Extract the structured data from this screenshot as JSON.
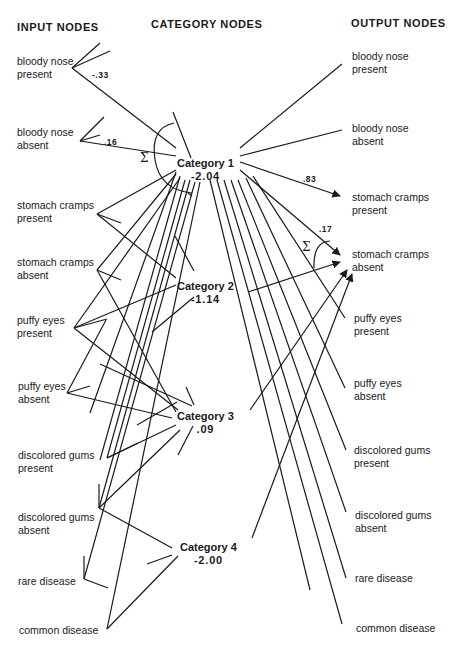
{
  "headers": {
    "input": "INPUT NODES",
    "category": "CATEGORY NODES",
    "output": "OUTPUT NODES"
  },
  "input_nodes": [
    {
      "label": "bloody nose\npresent",
      "x": 17,
      "y": 55,
      "anchor": [
        72,
        68
      ]
    },
    {
      "label": "bloody nose\nabsent",
      "x": 17,
      "y": 126,
      "anchor": [
        80,
        141
      ]
    },
    {
      "label": "stomach cramps\npresent",
      "x": 17,
      "y": 199,
      "anchor": [
        97,
        214
      ]
    },
    {
      "label": "stomach cramps\nabsent",
      "x": 17,
      "y": 256,
      "anchor": [
        97,
        270
      ]
    },
    {
      "label": "puffy eyes\npresent",
      "x": 17,
      "y": 314,
      "anchor": [
        74,
        328
      ]
    },
    {
      "label": "puffy eyes\nabsent",
      "x": 18,
      "y": 380,
      "anchor": [
        67,
        393
      ]
    },
    {
      "label": "discolored gums\npresent",
      "x": 18,
      "y": 449,
      "anchor": [
        107,
        458
      ]
    },
    {
      "label": "discolored gums\nabsent",
      "x": 18,
      "y": 511,
      "anchor": [
        99,
        508
      ]
    },
    {
      "label": "rare disease",
      "x": 18,
      "y": 575,
      "anchor": [
        84,
        579
      ]
    },
    {
      "label": "common disease",
      "x": 19,
      "y": 624,
      "anchor": [
        107,
        629
      ]
    }
  ],
  "category_nodes": [
    {
      "name": "Category  1",
      "value": "-2.04",
      "x": 177,
      "y": 157,
      "hub": [
        205,
        168
      ]
    },
    {
      "name": "Category  2",
      "value": "-1.14",
      "x": 177,
      "y": 280,
      "hub": [
        205,
        292
      ]
    },
    {
      "name": "Category  3",
      "value": ".09",
      "x": 177,
      "y": 410,
      "hub": [
        205,
        420
      ]
    },
    {
      "name": "Category  4",
      "value": "-2.00",
      "x": 180,
      "y": 541,
      "hub": [
        208,
        552
      ]
    }
  ],
  "output_nodes": [
    {
      "label": "bloody nose\npresent",
      "x": 352,
      "y": 50
    },
    {
      "label": "bloody nose\nabsent",
      "x": 352,
      "y": 122
    },
    {
      "label": "stomach cramps\npresent",
      "x": 352,
      "y": 191
    },
    {
      "label": "stomach cramps\nabsent",
      "x": 352,
      "y": 248
    },
    {
      "label": "puffy eyes\npresent",
      "x": 354,
      "y": 312
    },
    {
      "label": "puffy eyes\nabsent",
      "x": 354,
      "y": 377
    },
    {
      "label": "discolored gums\npresent",
      "x": 354,
      "y": 444
    },
    {
      "label": "discolored gums\nabsent",
      "x": 355,
      "y": 509
    },
    {
      "label": "rare disease",
      "x": 355,
      "y": 572
    },
    {
      "label": "common disease",
      "x": 356,
      "y": 622
    }
  ],
  "weights": [
    {
      "text": "-.33",
      "x": 92,
      "y": 70
    },
    {
      "text": ".16",
      "x": 104,
      "y": 137
    },
    {
      "text": ".83",
      "x": 303,
      "y": 174
    },
    {
      "text": ".17",
      "x": 319,
      "y": 224
    }
  ],
  "sigma_marks": [
    {
      "text": "Σ",
      "x": 140,
      "y": 151
    },
    {
      "text": "Σ",
      "x": 302,
      "y": 240
    }
  ],
  "colors": {
    "ink": "#1a1a1a",
    "background": "#ffffff"
  }
}
